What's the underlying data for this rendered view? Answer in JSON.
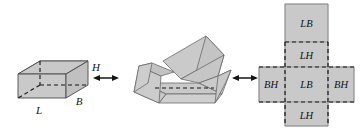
{
  "figure": {
    "background_color": "#ffffff",
    "face_fill_color": "#c8c8c8",
    "face_fill_color_light": "#d2d2d2",
    "outline_color": "#4a4a4a",
    "dashed_color": "#141414",
    "label_color": "#141414"
  },
  "solid": {
    "name": "cuboid",
    "dimension_labels": {
      "length": "L",
      "breadth": "B",
      "height": "H"
    }
  },
  "partial_fold": {
    "name": "partially-unfolded-box"
  },
  "net": {
    "name": "box-net",
    "faces": [
      {
        "id": "top-face",
        "label": "LB"
      },
      {
        "id": "upper-side-face",
        "label": "LH"
      },
      {
        "id": "left-face",
        "label": "BH"
      },
      {
        "id": "base-face",
        "label": "LB"
      },
      {
        "id": "right-face",
        "label": "BH"
      },
      {
        "id": "lower-side-face",
        "label": "LH"
      }
    ]
  },
  "arrows": [
    {
      "id": "arrow-left",
      "label": "",
      "direction": "double"
    },
    {
      "id": "arrow-right",
      "label": "",
      "direction": "double"
    }
  ]
}
